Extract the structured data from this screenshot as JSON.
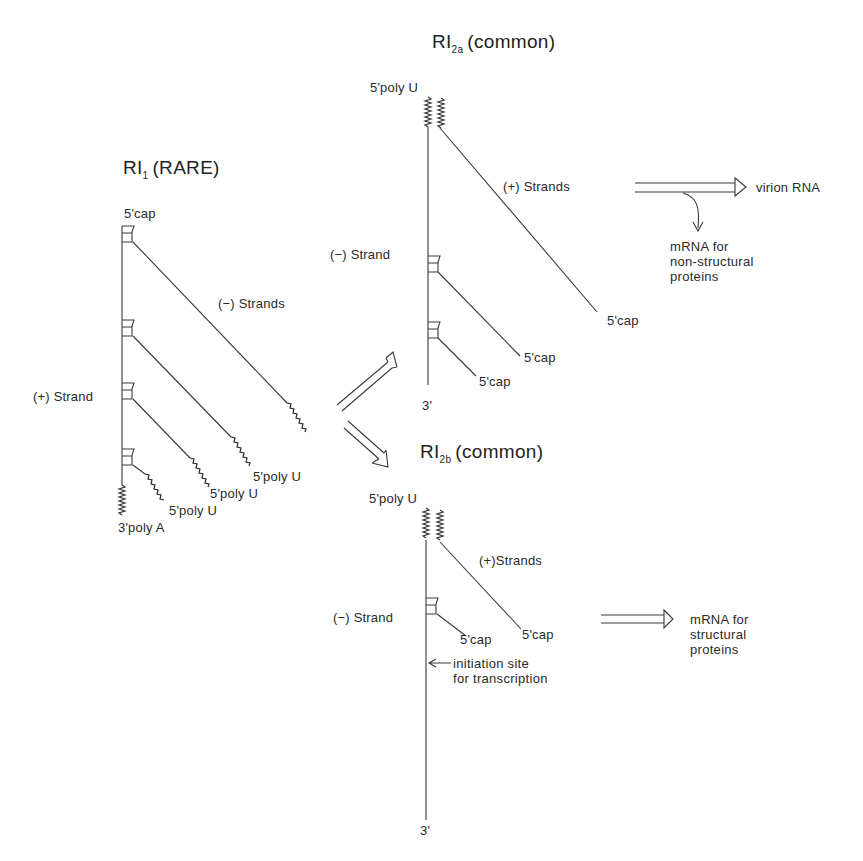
{
  "figure": {
    "line_color": "#3a3a3a"
  },
  "ri1": {
    "title_main": "RI",
    "title_sub": "1",
    "title_rest": "(RARE)",
    "label_5cap": "5'cap",
    "label_minus_strands": "(−) Strands",
    "label_plus_strand": "(+) Strand",
    "label_polyU_1": "5'poly U",
    "label_polyU_2": "5'poly U",
    "label_polyU_3": "5'poly U",
    "label_3polyA": "3'poly A"
  },
  "ri2a": {
    "title_main": "RI",
    "title_sub": "2a",
    "title_rest": "(common)",
    "label_5polyU": "5'poly U",
    "label_plus_strands": "(+) Strands",
    "label_minus_strand": "(−) Strand",
    "label_5cap_1": "5'cap",
    "label_5cap_2": "5'cap",
    "label_5cap_3": "5'cap",
    "label_3prime": "3'",
    "output_virion": "virion RNA",
    "output_mrna_lines": [
      "mRNA  for",
      "non-structural",
      "proteins"
    ]
  },
  "ri2b": {
    "title_main": "RI",
    "title_sub": "2b",
    "title_rest": "(common)",
    "label_5polyU": "5'poly U",
    "label_plus_strands": "(+)Strands",
    "label_minus_strand": "(−) Strand",
    "label_5cap_1": "5'cap",
    "label_5cap_2": "5'cap",
    "label_initiation_lines": [
      "initiation site",
      "for transcription"
    ],
    "label_3prime": "3'",
    "output_mrna_lines": [
      "mRNA  for",
      "structural",
      "proteins"
    ]
  }
}
